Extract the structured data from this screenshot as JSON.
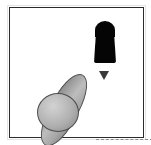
{
  "scene": {
    "title": "simulation-viewport",
    "background_color": "#ffffff",
    "frame": {
      "label": "viewport-border",
      "border_color": "#2b2b2b",
      "border_width_px": 1,
      "x": 9,
      "y": 7,
      "width": 135,
      "height": 131
    },
    "objects": [
      {
        "id": "capsule",
        "label": "black-capsule-object",
        "shape": "capsule",
        "color": "#050505",
        "x": 84,
        "y": 14,
        "width": 22,
        "height": 41
      },
      {
        "id": "marker",
        "label": "down-arrow-marker",
        "shape": "triangle-down",
        "color": "#3a3a3a",
        "x": 89,
        "y": 63,
        "width": 11,
        "height": 9
      },
      {
        "id": "spindle",
        "label": "gray-ellipsoid-body",
        "shape": "ellipsoid",
        "color": "#a9a9a9",
        "outline_color": "#4c4c4c",
        "rotation_deg": 28,
        "x": 40,
        "y": 62,
        "width": 28,
        "height": 80
      },
      {
        "id": "sphere",
        "label": "gray-sphere-body",
        "shape": "sphere",
        "color": "#c2c2c2",
        "outline_color": "#4c4c4c",
        "x": 27,
        "y": 85,
        "width": 42,
        "height": 39
      }
    ],
    "guides": [
      {
        "id": "dashline",
        "label": "dashed-ground-line",
        "style": "dashed",
        "color": "#8c8c8c",
        "x": 86,
        "y": 131,
        "length": 57
      }
    ]
  }
}
